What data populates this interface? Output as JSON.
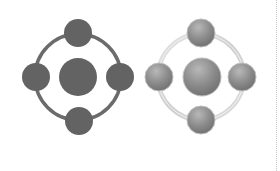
{
  "canvas": {
    "width": 280,
    "height": 171,
    "background": "#ffffff"
  },
  "icons": [
    {
      "name": "network-hub-icon-flat",
      "style": "flat",
      "center": [
        78,
        77
      ],
      "ring_radius": 43,
      "ring_color": "#6b6b6b",
      "hub_radius": 19,
      "node_radius": 14,
      "fill_color": "#636363",
      "nodes": [
        "top",
        "right",
        "bottom",
        "left"
      ]
    },
    {
      "name": "network-hub-icon-glossy",
      "style": "glossy",
      "center": [
        201,
        77
      ],
      "ring_radius": 43,
      "ring_color": "#d2d2d2",
      "hub_radius": 19,
      "node_radius": 14,
      "fill_color": "#8a8a8a",
      "nodes": [
        "top",
        "right",
        "bottom",
        "left"
      ]
    }
  ],
  "edge": {
    "style": "dotted",
    "color": "#c8c8c8"
  }
}
